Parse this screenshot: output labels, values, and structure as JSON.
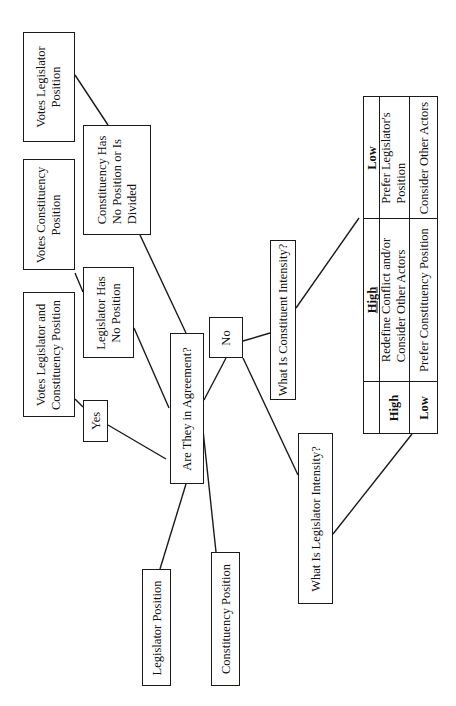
{
  "diagram": {
    "orientation": "rotated-90-ccw",
    "nodes": {
      "legislator_position": "Legislator Position",
      "constituency_position": "Constituency Position",
      "agreement_question": "Are They in Agreement?",
      "yes": "Yes",
      "no": "No",
      "votes_both": [
        "Votes Legislator and",
        "Constituency Position"
      ],
      "legislator_no_position": [
        "Legislator Has",
        "No Position"
      ],
      "votes_constituency": [
        "Votes Constituency",
        "Position"
      ],
      "constituency_no_position": [
        "Constituency Has",
        "No Position or Is",
        "Divided"
      ],
      "votes_legislator": [
        "Votes Legislator",
        "Position"
      ],
      "constituent_intensity": "What Is Constituent Intensity?",
      "legislator_intensity": "What Is Legislator Intensity?"
    },
    "table": {
      "column_headers": [
        "High",
        "Low"
      ],
      "row_headers": [
        "High",
        "Low"
      ],
      "cells": {
        "high_high": [
          "Redefine Conflict and/or",
          "Consider Other Actors"
        ],
        "high_low": [
          "Prefer Legislator's",
          "Position"
        ],
        "low_high": "Prefer Constituency Position",
        "low_low": "Consider Other Actors"
      }
    }
  }
}
